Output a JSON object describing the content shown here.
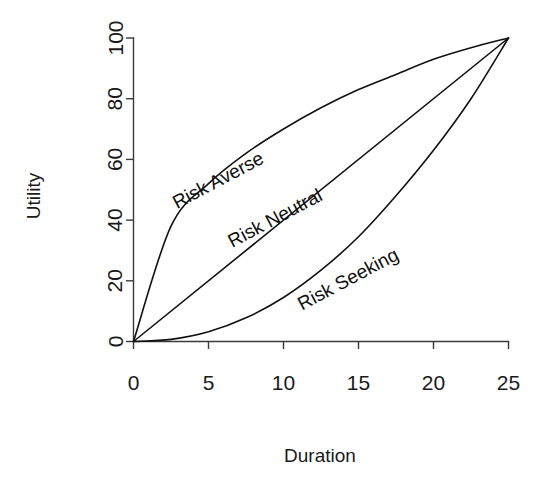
{
  "chart_data": {
    "type": "line",
    "title": "",
    "xlabel": "Duration",
    "ylabel": "Utility",
    "xlim": [
      0,
      25
    ],
    "ylim": [
      0,
      100
    ],
    "grid": false,
    "legend_position": "inline-curve-labels",
    "xticks": [
      "0",
      "5",
      "10",
      "15",
      "20",
      "25"
    ],
    "xtick_values": [
      0,
      5,
      10,
      15,
      20,
      25
    ],
    "yticks": [
      "0",
      "20",
      "40",
      "60",
      "80",
      "100"
    ],
    "ytick_values": [
      0,
      20,
      40,
      60,
      80,
      100
    ],
    "x": [
      0,
      2.5,
      5,
      7.5,
      10,
      12.5,
      15,
      17.5,
      20,
      22.5,
      25
    ],
    "series": [
      {
        "name": "Risk Averse",
        "shape": "concave",
        "values": [
          0,
          38,
          52,
          62,
          70,
          77,
          83,
          88,
          93,
          96.8,
          100
        ]
      },
      {
        "name": "Risk Neutral",
        "shape": "linear",
        "values": [
          0,
          10,
          20,
          30,
          40,
          50,
          60,
          70,
          80,
          90,
          100
        ]
      },
      {
        "name": "Risk Seeking",
        "shape": "convex",
        "values": [
          0,
          0.7,
          3.2,
          7.8,
          14.5,
          23.5,
          34.5,
          48,
          63,
          80,
          100
        ]
      }
    ],
    "annotations": [
      {
        "text": "Risk Averse",
        "rotation": -28,
        "near_series": "Risk Averse"
      },
      {
        "text": "Risk Neutral",
        "rotation": -28,
        "near_series": "Risk Neutral"
      },
      {
        "text": "Risk Seeking",
        "rotation": -28,
        "near_series": "Risk Seeking"
      }
    ]
  },
  "labels": {
    "y_axis_title": "Utility",
    "x_axis_title": "Duration",
    "risk_averse": "Risk Averse",
    "risk_neutral": "Risk Neutral",
    "risk_seeking": "Risk Seeking",
    "y0": "0",
    "y20": "20",
    "y40": "40",
    "y60": "60",
    "y80": "80",
    "y100": "100",
    "x0": "0",
    "x5": "5",
    "x10": "10",
    "x15": "15",
    "x20": "20",
    "x25": "25"
  },
  "colors": {
    "background": "#ffffff",
    "axis": "#3a3a3a",
    "curve": "#111111",
    "text": "#1a1a1a"
  }
}
